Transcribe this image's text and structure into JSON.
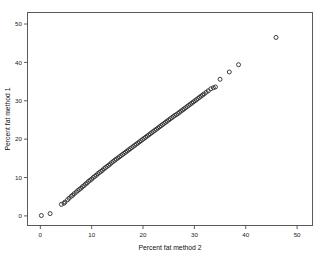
{
  "chart_data": {
    "type": "scatter",
    "title": "",
    "xlabel": "Percent fat method 2",
    "ylabel": "Percent fat method 1",
    "xlim": [
      -2.5,
      53
    ],
    "ylim": [
      -2.5,
      53
    ],
    "xticks": [
      0,
      10,
      20,
      30,
      40,
      50
    ],
    "yticks": [
      0,
      10,
      20,
      30,
      40,
      50
    ],
    "xticklabels": [
      "0",
      "10",
      "20",
      "30",
      "40",
      "50"
    ],
    "yticklabels": [
      "0",
      "10",
      "20",
      "30",
      "40",
      "50"
    ],
    "grid": false,
    "legend": false,
    "marker": "open-circle",
    "marker_color": "#2b2b2b",
    "frame_color": "#5a5a5a",
    "series": [
      {
        "name": "Percent fat method 1 vs method 2",
        "points": [
          [
            0.2,
            0.1
          ],
          [
            1.9,
            0.6
          ],
          [
            4.1,
            3.0
          ],
          [
            4.6,
            3.3
          ],
          [
            4.8,
            3.6
          ],
          [
            5.3,
            4.2
          ],
          [
            5.6,
            4.6
          ],
          [
            6.0,
            5.1
          ],
          [
            6.3,
            5.4
          ],
          [
            6.6,
            5.8
          ],
          [
            7.0,
            6.2
          ],
          [
            7.3,
            6.6
          ],
          [
            7.6,
            6.9
          ],
          [
            7.9,
            7.2
          ],
          [
            8.2,
            7.6
          ],
          [
            8.5,
            7.9
          ],
          [
            8.8,
            8.3
          ],
          [
            9.1,
            8.6
          ],
          [
            9.4,
            9.0
          ],
          [
            9.7,
            9.3
          ],
          [
            10.0,
            9.6
          ],
          [
            10.3,
            10.0
          ],
          [
            10.6,
            10.3
          ],
          [
            10.9,
            10.6
          ],
          [
            11.2,
            11.0
          ],
          [
            11.5,
            11.3
          ],
          [
            11.8,
            11.6
          ],
          [
            12.1,
            11.9
          ],
          [
            12.4,
            12.3
          ],
          [
            12.7,
            12.6
          ],
          [
            13.0,
            12.9
          ],
          [
            13.3,
            13.2
          ],
          [
            13.6,
            13.5
          ],
          [
            13.9,
            13.9
          ],
          [
            14.2,
            14.2
          ],
          [
            14.5,
            14.5
          ],
          [
            14.8,
            14.8
          ],
          [
            15.1,
            15.1
          ],
          [
            15.4,
            15.4
          ],
          [
            15.7,
            15.7
          ],
          [
            16.0,
            16.0
          ],
          [
            16.3,
            16.3
          ],
          [
            16.6,
            16.6
          ],
          [
            16.9,
            16.9
          ],
          [
            17.2,
            17.2
          ],
          [
            17.5,
            17.5
          ],
          [
            17.8,
            17.8
          ],
          [
            18.1,
            18.1
          ],
          [
            18.4,
            18.4
          ],
          [
            18.7,
            18.7
          ],
          [
            19.0,
            19.0
          ],
          [
            19.3,
            19.3
          ],
          [
            19.6,
            19.6
          ],
          [
            19.9,
            19.9
          ],
          [
            20.2,
            20.2
          ],
          [
            20.5,
            20.5
          ],
          [
            20.8,
            20.8
          ],
          [
            21.1,
            21.1
          ],
          [
            21.4,
            21.4
          ],
          [
            21.7,
            21.7
          ],
          [
            22.0,
            22.0
          ],
          [
            22.3,
            22.3
          ],
          [
            22.6,
            22.6
          ],
          [
            22.9,
            22.9
          ],
          [
            23.2,
            23.2
          ],
          [
            23.5,
            23.5
          ],
          [
            23.8,
            23.8
          ],
          [
            24.1,
            24.1
          ],
          [
            24.4,
            24.4
          ],
          [
            24.7,
            24.7
          ],
          [
            25.0,
            25.0
          ],
          [
            25.3,
            25.3
          ],
          [
            25.6,
            25.6
          ],
          [
            25.9,
            25.9
          ],
          [
            26.2,
            26.2
          ],
          [
            26.5,
            26.4
          ],
          [
            26.8,
            26.7
          ],
          [
            27.1,
            27.0
          ],
          [
            27.4,
            27.3
          ],
          [
            27.7,
            27.6
          ],
          [
            28.0,
            27.9
          ],
          [
            28.3,
            28.2
          ],
          [
            28.6,
            28.5
          ],
          [
            28.9,
            28.8
          ],
          [
            29.2,
            29.1
          ],
          [
            29.5,
            29.4
          ],
          [
            29.8,
            29.7
          ],
          [
            30.1,
            30.0
          ],
          [
            30.4,
            30.3
          ],
          [
            30.7,
            30.6
          ],
          [
            31.0,
            30.9
          ],
          [
            31.3,
            31.2
          ],
          [
            31.6,
            31.5
          ],
          [
            31.9,
            31.8
          ],
          [
            32.3,
            32.2
          ],
          [
            32.7,
            32.6
          ],
          [
            33.2,
            33.1
          ],
          [
            33.7,
            33.4
          ],
          [
            34.1,
            33.6
          ],
          [
            35.0,
            35.6
          ],
          [
            36.8,
            37.5
          ],
          [
            38.6,
            39.4
          ],
          [
            45.9,
            46.5
          ]
        ]
      }
    ]
  }
}
